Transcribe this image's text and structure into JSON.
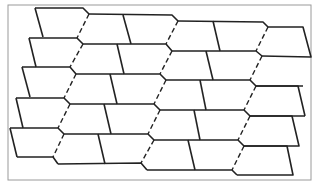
{
  "diagram": {
    "width": 317,
    "height": 186,
    "background": "#ffffff",
    "frame": {
      "x": 8,
      "y": 5,
      "w": 303,
      "h": 175,
      "stroke": "#9a9a9a",
      "width": 1
    },
    "stroke_color": "#222222",
    "solid_width": 1.6,
    "dashed_width": 1.4,
    "dash": "5,3",
    "solid_paths": [
      "M35,8 L83,8 L89,14",
      "M35,8 L43,37",
      "M29,38 L77,38 L83,44",
      "M29,38 L36,67",
      "M22,67 L70,67 L76,74",
      "M22,67 L30,97",
      "M16,98 L64,98 L70,104",
      "M16,98 L23,128",
      "M10,128 L58,128 L64,134",
      "M10,128 L17,157",
      "M17,157 L53,157 L58,164",
      "M89,14 L172,15 L178,21",
      "M123,15 L131,44",
      "M83,44 L166,44 L172,51",
      "M117,44 L124,74",
      "M76,74 L160,74 L166,80",
      "M110,74 L117,104",
      "M70,104 L154,104 L160,110",
      "M104,104 L111,134",
      "M64,134 L148,134 L154,140",
      "M98,134 L105,164",
      "M58,164 L141,163 L147,170",
      "M178,21 L263,22 L268,27",
      "M213,21 L220,51",
      "M172,51 L256,51 L262,56",
      "M206,51 L213,80",
      "M166,80 L250,80 L256,86",
      "M200,80 L206,110",
      "M160,110 L244,110 L250,116",
      "M194,110 L200,140",
      "M154,140 L238,140 L244,146",
      "M188,140 L195,170",
      "M147,170 L232,170 L237,175",
      "M268,27 L303,27 L311,57 L262,56",
      "M256,86 L298,86 L305,116",
      "M305,116 L250,116",
      "M256,86 L303,86",
      "M250,116 L292,116 L299,146 L244,146",
      "M244,146 L287,146 L293,175 L237,175"
    ],
    "dashed_paths": [
      "M89,14 L77,38",
      "M83,44 L70,67",
      "M76,74 L64,98",
      "M70,104 L58,128",
      "M64,134 L53,157",
      "M178,21 L166,44",
      "M172,51 L160,74",
      "M166,80 L154,104",
      "M160,110 L148,134",
      "M154,140 L141,163",
      "M268,27 L256,51",
      "M262,56 L250,80",
      "M256,86 L244,110",
      "M250,116 L238,140",
      "M244,146 L232,170"
    ]
  }
}
